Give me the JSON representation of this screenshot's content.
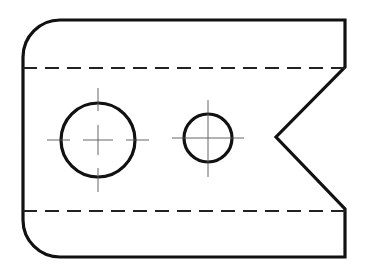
{
  "drawing": {
    "title": "Plate with two holes and V-notch",
    "view": "top view",
    "colors": {
      "background": "#ffffff",
      "outline": "#111111",
      "hidden": "#222222",
      "centerline": "#555555"
    },
    "outline": {
      "left_x": 23,
      "right_x": 345,
      "top_y": 20,
      "bottom_y": 257,
      "corner_radius": 37,
      "notch": {
        "upper_y": 67,
        "lower_y": 209,
        "apex_x": 276,
        "apex_y": 137
      }
    },
    "hidden_lines": [
      {
        "y": 68,
        "x1": 23,
        "x2": 345
      },
      {
        "y": 211,
        "x1": 23,
        "x2": 345
      }
    ],
    "holes": [
      {
        "name": "large-hole",
        "cx": 98,
        "cy": 140,
        "r": 37
      },
      {
        "name": "small-hole",
        "cx": 208,
        "cy": 138,
        "r": 24
      }
    ]
  }
}
